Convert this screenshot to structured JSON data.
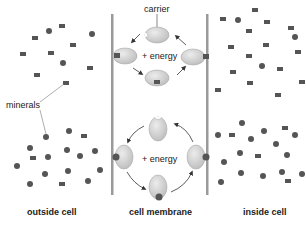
{
  "diagram": {
    "labels": {
      "carrier": "carrier",
      "energy_top": "+ energy",
      "energy_bottom": "+ energy",
      "minerals": "minerals",
      "outside": "outside cell",
      "membrane": "cell membrane",
      "inside": "inside cell"
    },
    "colors": {
      "membrane": "#9a9a9a",
      "carrier_fill": "#d2d2d2",
      "carrier_stroke": "#a8a8a8",
      "mineral": "#555555",
      "text": "#222222",
      "arrow": "#333333"
    }
  }
}
